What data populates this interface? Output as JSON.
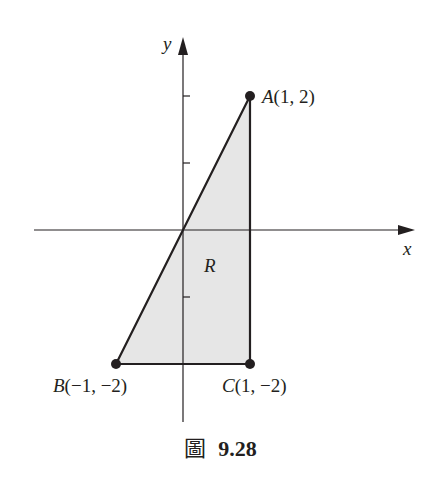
{
  "figure": {
    "caption_prefix": "圖",
    "caption_number": "9.28"
  },
  "axes": {
    "x_label": "x",
    "y_label": "y",
    "x_ticks": [
      1
    ],
    "y_ticks": [
      -2,
      -1,
      1,
      2
    ]
  },
  "region": {
    "label": "R",
    "fill_color": "#e6e6e6",
    "vertices": [
      {
        "name": "A",
        "x": 1,
        "y": 2,
        "label": "A(1, 2)"
      },
      {
        "name": "B",
        "x": -1,
        "y": -2,
        "label": "B(−1, −2)"
      },
      {
        "name": "C",
        "x": 1,
        "y": -2,
        "label": "C(1, −2)"
      }
    ]
  },
  "colors": {
    "ink": "#231f20",
    "fill": "#e6e6e6"
  }
}
